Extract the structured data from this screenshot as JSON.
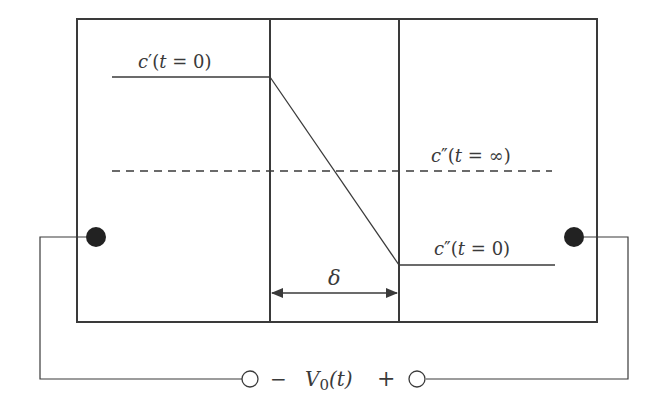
{
  "diagram": {
    "type": "electrochemical membrane cell",
    "labels": {
      "c_left_t0": {
        "base": "c",
        "prime": "′",
        "arg_open": "(",
        "t": "t",
        "eq": " = ",
        "val": "0",
        "arg_close": ")"
      },
      "c_right_tinf": {
        "base": "c",
        "prime": "″",
        "arg_open": "(",
        "t": "t",
        "eq": " = ",
        "val": "∞",
        "arg_close": ")"
      },
      "c_right_t0": {
        "base": "c",
        "prime": "″",
        "arg_open": "(",
        "t": "t",
        "eq": " = ",
        "val": "0",
        "arg_close": ")"
      },
      "delta": "δ",
      "voltage": {
        "minus": "−",
        "V": "V",
        "sub": "0",
        "arg": "(t)",
        "plus": "+"
      }
    },
    "colors": {
      "stroke": "#3a3a3a",
      "electrode": "#222222",
      "background": "#ffffff"
    }
  }
}
